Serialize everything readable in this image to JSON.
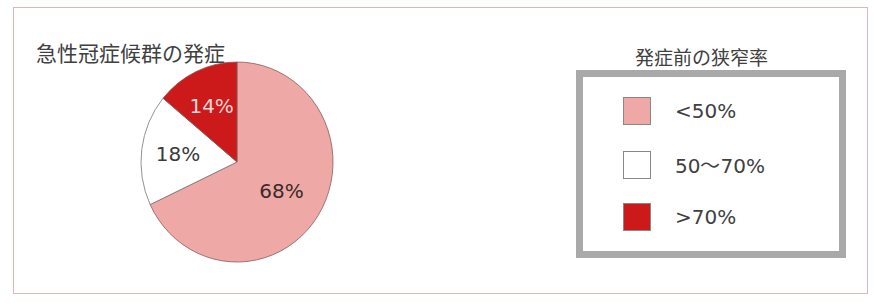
{
  "chart_data": {
    "type": "pie",
    "title": "急性冠症候群の発症",
    "legend_title": "発症前の狭窄率",
    "legend_position": "right",
    "categories": [
      "<50%",
      "50～70%",
      ">70%"
    ],
    "values": [
      68,
      18,
      14
    ],
    "labels": [
      "68%",
      "18%",
      "14%"
    ],
    "colors": [
      "#eea9a6",
      "#ffffff",
      "#cc1a1a"
    ],
    "start_angle": "12 o'clock, clockwise"
  },
  "chart": {
    "title": "急性冠症候群の発症",
    "slices": [
      {
        "label": "68%",
        "value": 68,
        "color": "#eea9a6",
        "text_color": "#3a2a2a"
      },
      {
        "label": "18%",
        "value": 18,
        "color": "#ffffff",
        "text_color": "#3a3a3a"
      },
      {
        "label": "14%",
        "value": 14,
        "color": "#cc1a1a",
        "text_color": "#f4d6d6"
      }
    ]
  },
  "legend": {
    "title": "発症前の狭窄率",
    "items": [
      {
        "label": "<50%",
        "color": "#eea9a6"
      },
      {
        "label": "50～70%",
        "color": "#ffffff"
      },
      {
        "label": ">70%",
        "color": "#cc1a1a"
      }
    ],
    "border_color": "#a9a9a9"
  }
}
